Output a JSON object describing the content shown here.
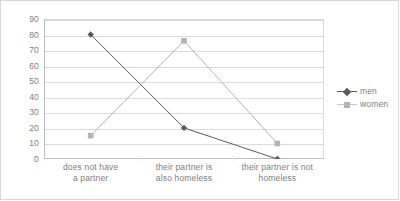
{
  "chart_data": {
    "type": "line",
    "title": "",
    "xlabel": "",
    "ylabel": "",
    "ylim": [
      0,
      90
    ],
    "yticks": [
      0,
      10,
      20,
      30,
      40,
      50,
      60,
      70,
      80,
      90
    ],
    "grid": true,
    "legend_position": "right",
    "categories": [
      "does not have a partner",
      "their partner is also homeless",
      "their partner is not homeless"
    ],
    "category_lines": [
      [
        "does not have",
        "a partner"
      ],
      [
        "their partner is",
        "also homeless"
      ],
      [
        "their partner is not",
        "homeless"
      ]
    ],
    "series": [
      {
        "name": "men",
        "values": [
          80,
          20,
          0
        ],
        "color": "#595959",
        "marker": "diamond"
      },
      {
        "name": "women",
        "values": [
          15,
          76,
          10
        ],
        "color": "#b3b3b3",
        "marker": "square"
      }
    ]
  },
  "legend": {
    "items": [
      {
        "label": "men",
        "marker": "diamond-marker-icon",
        "color": "#595959"
      },
      {
        "label": "women",
        "marker": "square-marker-icon",
        "color": "#b3b3b3"
      }
    ]
  },
  "colors": {
    "men": "#595959",
    "women": "#b3b3b3",
    "gridline": "#dcdcdc",
    "axis": "#bdbdbd",
    "text": "#7e7e7e",
    "border": "#d8d8d8",
    "background": "#ffffff"
  }
}
